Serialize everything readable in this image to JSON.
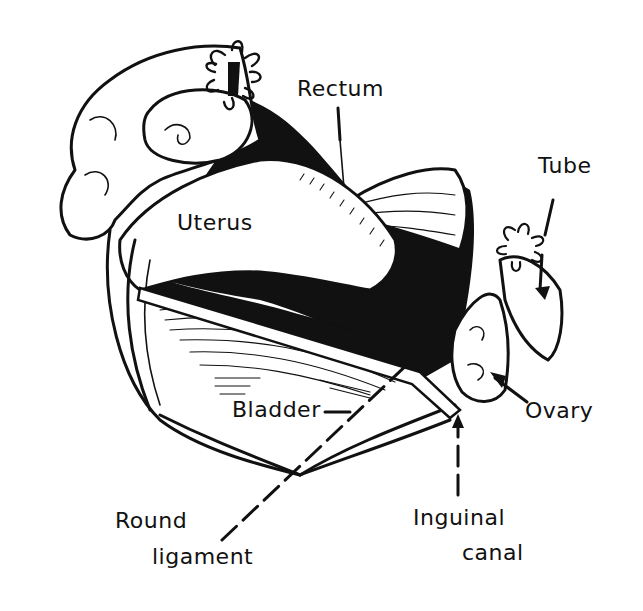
{
  "diagram": {
    "colors": {
      "ink": "#111111",
      "background": "#ffffff"
    },
    "labels": {
      "rectum": "Rectum",
      "tube": "Tube",
      "uterus": "Uterus",
      "bladder": "Bladder",
      "ovary": "Ovary",
      "round_ligament_line1": "Round",
      "round_ligament_line2": "ligament",
      "inguinal_canal_line1": "Inguinal",
      "inguinal_canal_line2": "canal"
    }
  }
}
